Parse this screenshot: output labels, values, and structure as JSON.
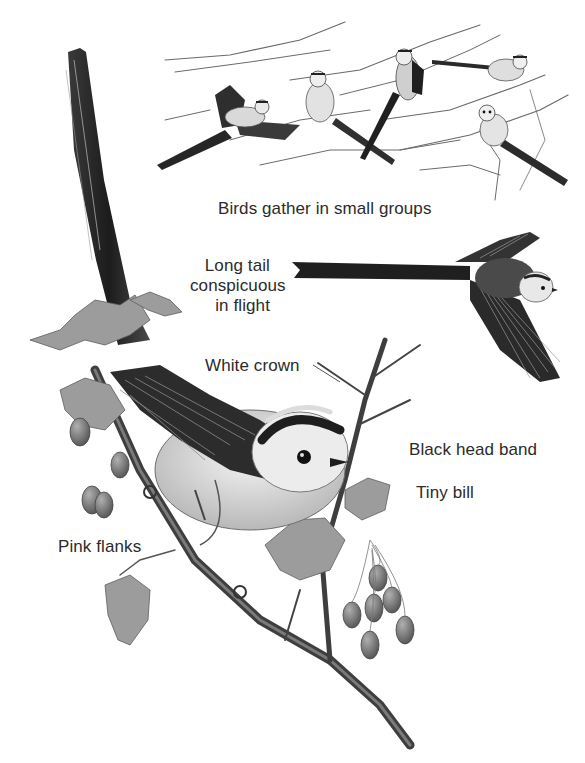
{
  "illustration": {
    "subject": "Long-tailed tit",
    "palette": {
      "background": "#ffffff",
      "text": "#2b2b2b",
      "ink_dark": "#1e1e1e",
      "ink_mid": "#6b6b6b",
      "ink_light": "#bdbdbd",
      "berry": "#7a7a7a"
    },
    "panels": [
      {
        "name": "flock-on-branches",
        "bird_count": 5
      },
      {
        "name": "bird-in-flight",
        "bird_count": 1
      },
      {
        "name": "perched-bird-main",
        "bird_count": 1
      }
    ]
  },
  "labels": {
    "groups": "Birds gather in small groups",
    "tail": {
      "line1": "Long tail",
      "line2": "conspicuous",
      "line3": "in flight"
    },
    "crown": "White crown",
    "head_band": "Black head band",
    "bill": "Tiny bill",
    "flanks": "Pink flanks"
  }
}
